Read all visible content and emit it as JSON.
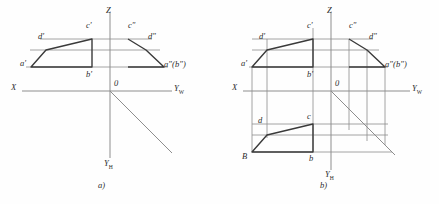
{
  "figure": {
    "background": "#fefefe",
    "ink_strong": "#3a3a3a",
    "ink_light": "#8e8e8e",
    "panels": [
      {
        "id": "a",
        "caption": "a)",
        "axes": {
          "x_label": "X",
          "z_label": "Z",
          "origin_label": "0",
          "y_w_label": "Y",
          "y_w_sub": "W",
          "y_h_label": "Y",
          "y_h_sub": "H"
        },
        "vertex_labels": [
          {
            "name": "a-prime",
            "text": "a'"
          },
          {
            "name": "d-prime",
            "text": "d'"
          },
          {
            "name": "c-prime",
            "text": "c'"
          },
          {
            "name": "b-prime",
            "text": "b'"
          },
          {
            "name": "c-double-prime",
            "text": "c\""
          },
          {
            "name": "d-double-prime",
            "text": "d\""
          },
          {
            "name": "a-b-double-prime",
            "text": "a\"(b\")"
          }
        ]
      },
      {
        "id": "b",
        "caption": "b)",
        "axes": {
          "x_label": "X",
          "z_label": "Z",
          "origin_label": "0",
          "y_w_label": "Y",
          "y_w_sub": "W",
          "y_h_label": "Y",
          "y_h_sub": "H"
        },
        "vertex_labels": [
          {
            "name": "a-prime",
            "text": "a'"
          },
          {
            "name": "d-prime",
            "text": "d'"
          },
          {
            "name": "c-prime",
            "text": "c'"
          },
          {
            "name": "b-prime",
            "text": "b'"
          },
          {
            "name": "c-double-prime",
            "text": "c\""
          },
          {
            "name": "d-double-prime",
            "text": "d\""
          },
          {
            "name": "a-b-double-prime",
            "text": "a\"(b\")"
          },
          {
            "name": "d-plain",
            "text": "d"
          },
          {
            "name": "c-plain",
            "text": "c"
          },
          {
            "name": "B-plain",
            "text": "B"
          },
          {
            "name": "b-plain",
            "text": "b"
          }
        ]
      }
    ]
  }
}
